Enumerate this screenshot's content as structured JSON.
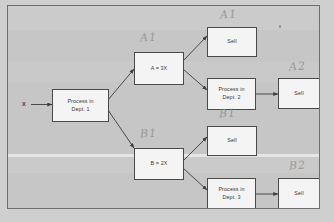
{
  "diagram": {
    "input_label": "X",
    "nodes": [
      {
        "id": "proc1",
        "lines": [
          "Process in",
          "Dept. 1"
        ]
      },
      {
        "id": "a3x",
        "lines": [
          "A = 3X"
        ]
      },
      {
        "id": "b2x",
        "lines": [
          "B = 2X"
        ]
      },
      {
        "id": "sell_a1",
        "lines": [
          "Sell"
        ]
      },
      {
        "id": "proc2",
        "lines": [
          "Process in",
          "Dept. 2"
        ]
      },
      {
        "id": "sell_a2",
        "lines": [
          "Sell"
        ]
      },
      {
        "id": "sell_b1",
        "lines": [
          "Sell"
        ]
      },
      {
        "id": "proc3",
        "lines": [
          "Process in",
          "Dept. 3"
        ]
      },
      {
        "id": "sell_b2",
        "lines": [
          "Sell"
        ]
      }
    ],
    "annotations": [
      {
        "id": "ann_a1_branch",
        "text": "A1"
      },
      {
        "id": "ann_a1_sell",
        "text": "A1"
      },
      {
        "id": "ann_a2_sell",
        "text": "A2"
      },
      {
        "id": "ann_b1_branch",
        "text": "B1"
      },
      {
        "id": "ann_b1_sell",
        "text": "B1"
      },
      {
        "id": "ann_b2_sell",
        "text": "B2"
      }
    ],
    "colors": {
      "page_background": "#cfcfcf",
      "sheet_background": "#c6c6c6",
      "sheet_border": "#6e6e6e",
      "node_fill": "#f4f4f4",
      "node_border": "#4a4a4a",
      "text": "#3a3a3a",
      "annotation": "#8a8a8a",
      "connector": "#3c3c3c"
    }
  }
}
